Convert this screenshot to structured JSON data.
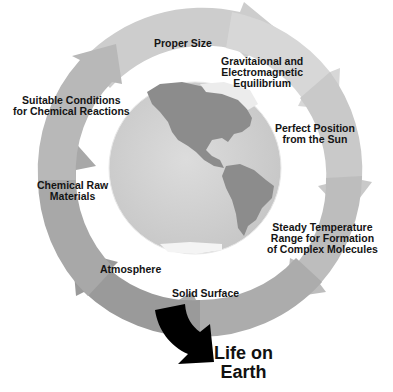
{
  "diagram": {
    "cycle_labels": [
      {
        "id": "proper-size",
        "lines": [
          "Proper Size"
        ]
      },
      {
        "id": "equilibrium",
        "lines": [
          "Gravitaional and",
          "Electromagnetic",
          "Equilibrium"
        ]
      },
      {
        "id": "position",
        "lines": [
          "Perfect Position",
          "from the Sun"
        ]
      },
      {
        "id": "temperature",
        "lines": [
          "Steady Temperature",
          "Range for Formation",
          "of Complex Molecules"
        ]
      },
      {
        "id": "solid-surface",
        "lines": [
          "Solid Surface"
        ]
      },
      {
        "id": "atmosphere",
        "lines": [
          "Atmosphere"
        ]
      },
      {
        "id": "raw-materials",
        "lines": [
          "Chemical Raw",
          "Materials"
        ]
      },
      {
        "id": "conditions",
        "lines": [
          "Suitable Conditions",
          "for Chemical Reactions"
        ]
      }
    ],
    "outcome": {
      "lines": [
        "Life on",
        "Earth"
      ]
    },
    "center_image": "globe-americas-icon",
    "colors": {
      "ring_light": "#cfcfcf",
      "ring_mid": "#b4b4b4",
      "ring_dark": "#8f8f8f",
      "globe_ocean": "#d2d2d2",
      "globe_land": "#8a8a8a",
      "outcome_arrow": "#000000",
      "text": "#141414"
    }
  }
}
